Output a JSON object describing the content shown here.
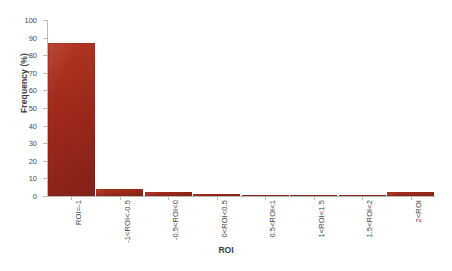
{
  "chart_data": {
    "type": "bar",
    "title": "",
    "xlabel": "ROI",
    "ylabel": "Frequency (%)",
    "categories": [
      "ROI=-1",
      "-1<ROI<-0.5",
      "-0.5<ROI<0",
      "0<ROI<0.5",
      "0.5<ROI<1",
      "1<ROI<1.5",
      "1.5<ROI<2",
      "2<ROI"
    ],
    "values": [
      87,
      4,
      2,
      1.2,
      0.2,
      0.2,
      0.2,
      2
    ],
    "ylim": [
      0,
      100
    ],
    "ytick_labels": [
      "0",
      "10",
      "20",
      "30",
      "40",
      "50",
      "60",
      "70",
      "80",
      "90",
      "100"
    ],
    "ytick_values": [
      0,
      10,
      20,
      30,
      40,
      50,
      60,
      70,
      80,
      90,
      100
    ],
    "grid": false,
    "legend": null,
    "bar_color": "#a32a1c"
  }
}
